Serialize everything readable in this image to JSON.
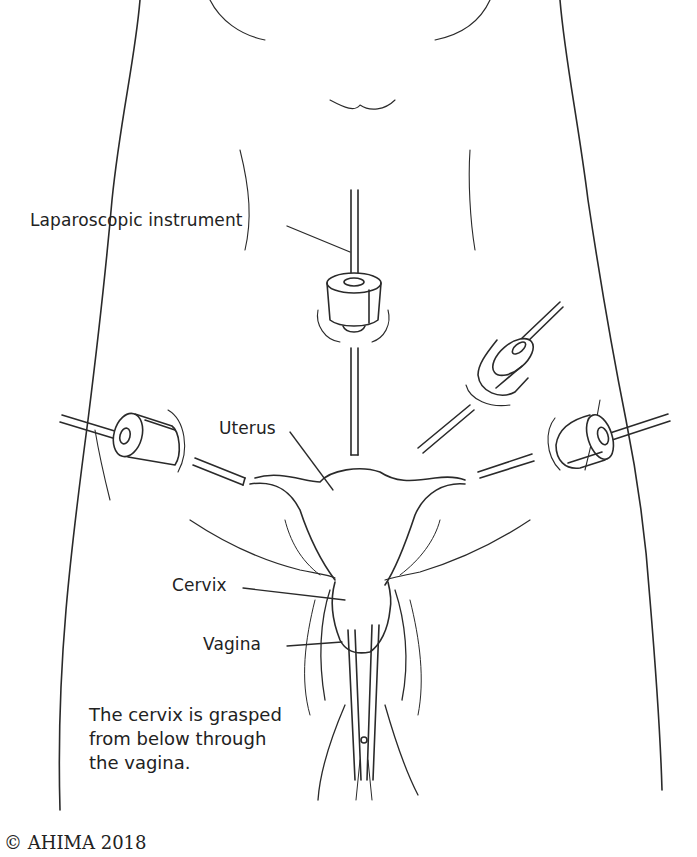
{
  "figure": {
    "labels": {
      "instrument": "Laparoscopic instrument",
      "uterus": "Uterus",
      "cervix": "Cervix",
      "vagina": "Vagina"
    },
    "caption": {
      "line1": "The cervix is grasped",
      "line2": "from below through",
      "line3": "the vagina."
    },
    "copyright": "© AHIMA 2018",
    "colors": {
      "line": "#2a2a2a",
      "background": "#ffffff"
    }
  }
}
